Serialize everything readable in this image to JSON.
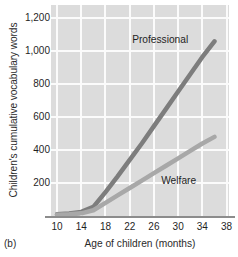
{
  "figure": {
    "panel_tag": "(b)",
    "background_color": "#ffffff",
    "plot_background_color": "#dcdcdc",
    "gridline_color": "#fbfbfb",
    "axis_line_color": "#8c8c8c"
  },
  "chart_data": {
    "type": "line",
    "title": "",
    "xlabel": "Age of children (months)",
    "ylabel": "Children's cumulative vocabulary words",
    "xlim": [
      9,
      38.4
    ],
    "ylim": [
      0,
      1280
    ],
    "xticks": [
      10,
      14,
      18,
      22,
      26,
      30,
      34,
      38
    ],
    "xtick_labels": [
      "10",
      "14",
      "18",
      "22",
      "26",
      "30",
      "34",
      "38"
    ],
    "yticks": [
      200,
      400,
      600,
      800,
      1000,
      1200
    ],
    "ytick_labels": [
      "200",
      "400",
      "600",
      "800",
      "1,000",
      "1,200"
    ],
    "grid": true,
    "legend": "inline-annotations",
    "series": [
      {
        "name": "Professional",
        "label": "Professional",
        "color": "#7d7d7d",
        "linewidth": 4.5,
        "label_position": {
          "x": 22.4,
          "y": 1065
        },
        "x": [
          10,
          12,
          14,
          16,
          18,
          20,
          22,
          24,
          26,
          28,
          30,
          32,
          34,
          36
        ],
        "y": [
          10,
          15,
          25,
          55,
          145,
          240,
          340,
          440,
          545,
          650,
          755,
          860,
          965,
          1060
        ]
      },
      {
        "name": "Welfare",
        "label": "Welfare",
        "color": "#a8a8a8",
        "linewidth": 4.5,
        "label_position": {
          "x": 27.2,
          "y": 215
        },
        "x": [
          10,
          12,
          14,
          16,
          18,
          20,
          22,
          24,
          26,
          28,
          30,
          32,
          34,
          36
        ],
        "y": [
          8,
          10,
          16,
          35,
          80,
          125,
          170,
          215,
          260,
          305,
          350,
          395,
          440,
          480
        ]
      }
    ]
  }
}
